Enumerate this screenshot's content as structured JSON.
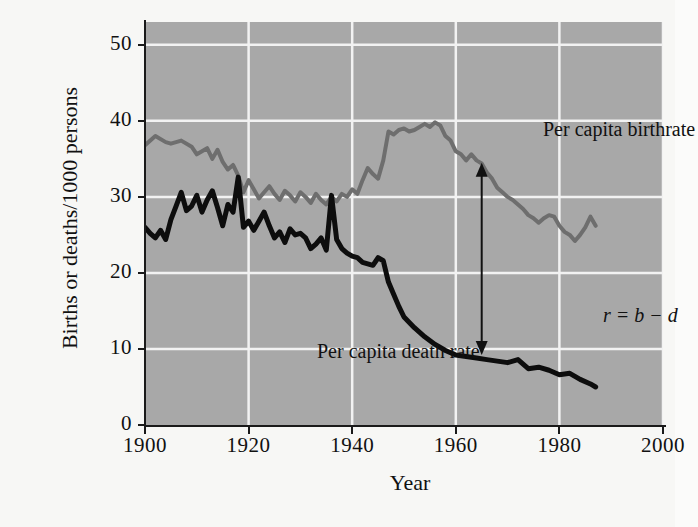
{
  "chart_data": {
    "type": "line",
    "title": "",
    "xlabel": "Year",
    "ylabel": "Births or deaths/1000 persons",
    "xlim": [
      1900,
      2000
    ],
    "ylim": [
      0,
      53
    ],
    "xticks": [
      1900,
      1920,
      1940,
      1960,
      1980,
      2000
    ],
    "yticks": [
      0,
      10,
      20,
      30,
      40,
      50
    ],
    "grid": true,
    "plot_background": "#a8a8a8",
    "gridline_color": "#f2f2f2",
    "legend_position": "in-plot-labels",
    "annotations": [
      {
        "name": "r-equation",
        "text": "r = b − d",
        "x": 1966,
        "y": 21,
        "style": "italic"
      },
      {
        "name": "growth-rate-arrow",
        "type": "double-headed-arrow",
        "x": 1965,
        "y_top": 34.5,
        "y_bottom": 9.2,
        "color": "#111111"
      }
    ],
    "series": [
      {
        "name": "Per capita birthrate",
        "label": "Per capita birthrate",
        "color": "#6e6e6e",
        "line_width": 4,
        "x": [
          1900,
          1902,
          1904,
          1905,
          1907,
          1909,
          1910,
          1912,
          1913,
          1914,
          1915,
          1916,
          1917,
          1918,
          1919,
          1920,
          1921,
          1922,
          1923,
          1924,
          1925,
          1926,
          1927,
          1928,
          1929,
          1930,
          1931,
          1932,
          1933,
          1934,
          1935,
          1936,
          1937,
          1938,
          1939,
          1940,
          1941,
          1942,
          1943,
          1944,
          1945,
          1946,
          1947,
          1948,
          1949,
          1950,
          1951,
          1952,
          1953,
          1954,
          1955,
          1956,
          1957,
          1958,
          1959,
          1960,
          1961,
          1962,
          1963,
          1964,
          1965,
          1966,
          1967,
          1968,
          1969,
          1970,
          1971,
          1972,
          1973,
          1974,
          1975,
          1976,
          1977,
          1978,
          1979,
          1980,
          1981,
          1982,
          1983,
          1984,
          1985,
          1986,
          1987
        ],
        "y": [
          36.8,
          38.0,
          37.2,
          37.0,
          37.4,
          36.6,
          35.6,
          36.4,
          35.0,
          36.2,
          34.6,
          33.6,
          34.2,
          32.8,
          30.6,
          32.2,
          31.0,
          29.8,
          30.6,
          31.4,
          30.4,
          29.6,
          30.8,
          30.2,
          29.4,
          30.6,
          30.0,
          29.2,
          30.4,
          29.6,
          29.0,
          30.0,
          29.4,
          30.4,
          30.0,
          31.0,
          30.4,
          32.2,
          33.8,
          33.0,
          32.4,
          34.8,
          38.6,
          38.2,
          38.8,
          39.0,
          38.6,
          38.8,
          39.2,
          39.6,
          39.2,
          39.8,
          39.4,
          38.0,
          37.4,
          36.0,
          35.6,
          34.8,
          35.6,
          34.8,
          34.4,
          33.2,
          32.4,
          31.2,
          30.6,
          30.0,
          29.6,
          29.0,
          28.4,
          27.6,
          27.2,
          26.6,
          27.2,
          27.6,
          27.4,
          26.2,
          25.4,
          25.0,
          24.2,
          25.0,
          26.0,
          27.4,
          26.2
        ]
      },
      {
        "name": "Per capita death rate",
        "label": "Per capita death rate",
        "color": "#0d0d0d",
        "line_width": 5,
        "x": [
          1900,
          1901,
          1902,
          1903,
          1904,
          1905,
          1906,
          1907,
          1908,
          1909,
          1910,
          1911,
          1912,
          1913,
          1914,
          1915,
          1916,
          1917,
          1918,
          1919,
          1920,
          1921,
          1922,
          1923,
          1924,
          1925,
          1926,
          1927,
          1928,
          1929,
          1930,
          1931,
          1932,
          1933,
          1934,
          1935,
          1936,
          1937,
          1938,
          1939,
          1940,
          1941,
          1942,
          1943,
          1944,
          1945,
          1946,
          1947,
          1948,
          1949,
          1950,
          1952,
          1954,
          1956,
          1958,
          1960,
          1962,
          1964,
          1966,
          1968,
          1970,
          1972,
          1974,
          1976,
          1978,
          1980,
          1982,
          1984,
          1986,
          1987
        ],
        "y": [
          26.0,
          25.2,
          24.6,
          25.6,
          24.4,
          27.0,
          28.8,
          30.6,
          28.2,
          28.8,
          30.2,
          28.0,
          29.6,
          30.8,
          28.6,
          26.2,
          29.0,
          28.0,
          32.6,
          26.0,
          26.8,
          25.6,
          26.8,
          28.0,
          26.2,
          24.6,
          25.4,
          24.0,
          25.8,
          25.0,
          25.2,
          24.6,
          23.2,
          23.8,
          24.6,
          23.0,
          30.2,
          24.4,
          23.2,
          22.6,
          22.2,
          22.0,
          21.4,
          21.2,
          21.0,
          22.0,
          21.6,
          18.8,
          17.2,
          15.6,
          14.2,
          12.8,
          11.6,
          10.6,
          9.8,
          9.2,
          9.0,
          8.8,
          8.6,
          8.4,
          8.2,
          8.6,
          7.4,
          7.6,
          7.2,
          6.6,
          6.8,
          6.0,
          5.4,
          5.0
        ]
      }
    ]
  },
  "axis": {
    "y_title": "Births or deaths/1000 persons",
    "x_title": "Year",
    "y_ticks": [
      "50",
      "40",
      "30",
      "20",
      "10",
      "0"
    ],
    "x_ticks": [
      "1900",
      "1920",
      "1940",
      "1960",
      "1980",
      "2000"
    ]
  },
  "labels": {
    "birthrate": "Per capita birthrate",
    "deathrate": "Per capita death rate",
    "r_equation": "r = b − d"
  }
}
